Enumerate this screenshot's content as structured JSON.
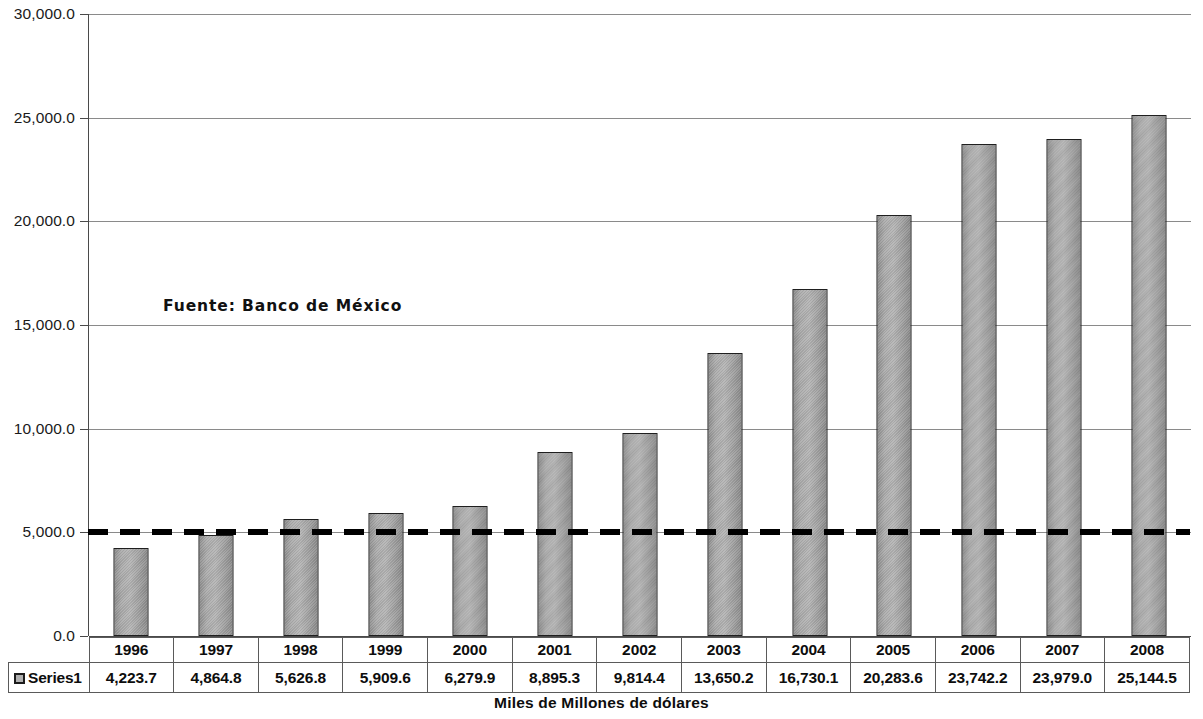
{
  "chart_data": {
    "type": "bar",
    "title": "",
    "subtitle": "",
    "xlabel": "Miles de Millones de dólares",
    "ylabel": "",
    "categories": [
      "1996",
      "1997",
      "1998",
      "1999",
      "2000",
      "2001",
      "2002",
      "2003",
      "2004",
      "2005",
      "2006",
      "2007",
      "2008"
    ],
    "series": [
      {
        "name": "Series1",
        "values": [
          4223.7,
          4864.8,
          5626.8,
          5909.6,
          6279.9,
          8895.3,
          9814.4,
          13650.2,
          16730.1,
          20283.6,
          23742.2,
          23979.0,
          25144.5
        ],
        "value_labels": [
          "4,223.7",
          "4,864.8",
          "5,626.8",
          "5,909.6",
          "6,279.9",
          "8,895.3",
          "9,814.4",
          "13,650.2",
          "16,730.1",
          "20,283.6",
          "23,742.2",
          "23,979.0",
          "25,144.5"
        ],
        "color": "#a3a3a3",
        "border_color": "#1f1f1f"
      }
    ],
    "ylim": [
      0,
      30000
    ],
    "ytick_values": [
      0,
      5000,
      10000,
      15000,
      20000,
      25000,
      30000
    ],
    "ytick_labels": [
      "0.0",
      "5,000.0",
      "10,000.0",
      "15,000.0",
      "20,000.0",
      "25,000.0",
      "30,000.0"
    ],
    "grid": true,
    "grid_color": "#8a8a8a",
    "legend_position": "data-table",
    "annotations": [
      {
        "text": "Fuente: Banco de México",
        "x_value": "1998",
        "y_value": 15500
      }
    ],
    "reference_line": {
      "y_value": 5000,
      "style": "dashed",
      "color": "#000000",
      "width_px": 6
    },
    "data_table": {
      "show": true,
      "row_label": "Series1",
      "legend_marker": "square-swatch"
    }
  },
  "axis": {
    "y_labels": [
      "30,000.0",
      "25,000.0",
      "20,000.0",
      "15,000.0",
      "10,000.0",
      "5,000.0",
      "0.0"
    ],
    "x_title": "Miles de Millones de dólares"
  },
  "annotation": {
    "source_note": "Fuente: Banco de México"
  },
  "table": {
    "legend_label": "Series1",
    "years": [
      "1996",
      "1997",
      "1998",
      "1999",
      "2000",
      "2001",
      "2002",
      "2003",
      "2004",
      "2005",
      "2006",
      "2007",
      "2008"
    ],
    "values": [
      "4,223.7",
      "4,864.8",
      "5,626.8",
      "5,909.6",
      "6,279.9",
      "8,895.3",
      "9,814.4",
      "13,650.2",
      "16,730.1",
      "20,283.6",
      "23,742.2",
      "23,979.0",
      "25,144.5"
    ]
  }
}
